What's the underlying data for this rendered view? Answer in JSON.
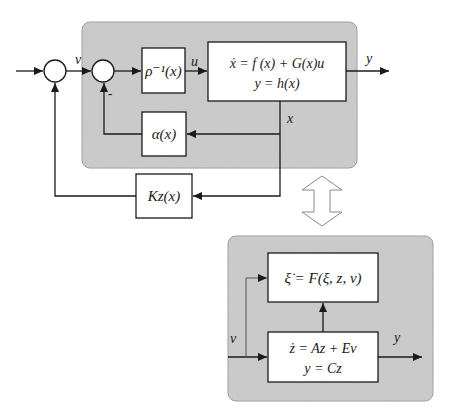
{
  "diagram": {
    "type": "block-diagram",
    "title": "",
    "colors": {
      "panel_fill": "#c8c8c8",
      "panel_stroke": "#9a9a9a",
      "line": "#1a1a1a",
      "block_fill": "#ffffff"
    },
    "top_panel": {
      "signals": {
        "v": "v",
        "u": "u",
        "y": "y",
        "x": "x"
      },
      "minus_sign": "-",
      "blocks": {
        "rho_inv": "ρ⁻¹(x)",
        "plant_line1": "ẋ = f (x) + G(x)u",
        "plant_line2": "y = h(x)",
        "alpha": "α(x)",
        "kz": "Kz(x)"
      }
    },
    "bottom_panel": {
      "signals": {
        "v": "v",
        "y": "y"
      },
      "blocks": {
        "xi_dyn": "ξ̇ = F(ξ, z, v)",
        "z_line1": "ż = Az + Ev",
        "z_line2": "y = Cz"
      }
    },
    "equivalence_arrow": "double-headed-arrow"
  }
}
